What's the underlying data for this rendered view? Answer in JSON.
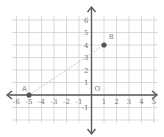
{
  "chart_data": {
    "type": "scatter",
    "title": "",
    "xlabel": "",
    "ylabel": "",
    "xlim": [
      -6,
      5
    ],
    "ylim": [
      -2,
      6
    ],
    "grid": true,
    "origin_label": "O",
    "x_ticks": [
      -6,
      -5,
      -4,
      -3,
      -2,
      -1,
      1,
      2,
      3,
      4,
      5
    ],
    "x_tick_labels": [
      "-6",
      "-5",
      "-4",
      "-3",
      "-2",
      "-1",
      "1",
      "2",
      "3",
      "4",
      "5"
    ],
    "y_ticks": [
      6,
      5,
      4,
      3,
      2,
      1,
      -1
    ],
    "y_tick_labels": [
      "6",
      "5",
      "4",
      "3",
      "2",
      "1",
      "-1"
    ],
    "points": [
      {
        "name": "A",
        "x": -5,
        "y": 0
      },
      {
        "name": "B",
        "x": 1,
        "y": 4
      }
    ],
    "segments": [
      {
        "from": "A",
        "to": "B",
        "style": "dotted"
      }
    ]
  },
  "colors": {
    "axis": "#5a5a5a",
    "grid": "#cfcfcf",
    "point": "#555555",
    "segment": "#bdbdbd"
  }
}
